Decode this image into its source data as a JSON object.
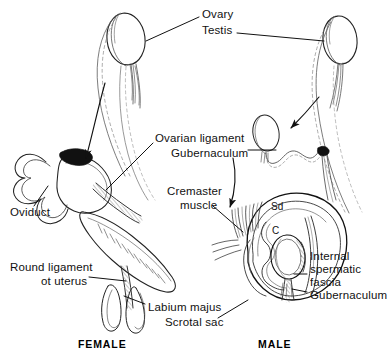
{
  "figure": {
    "background_color": "#ffffff",
    "ink_color": "#111111"
  },
  "captions": [
    {
      "id": "female",
      "text": "FEMALE",
      "x": 78,
      "y": 344
    },
    {
      "id": "male",
      "text": "MALE",
      "x": 258,
      "y": 344
    }
  ],
  "labels": [
    {
      "id": "ovary",
      "text": "Ovary",
      "x": 202,
      "y": 14,
      "align": "left"
    },
    {
      "id": "testis",
      "text": "Testis",
      "x": 202,
      "y": 30,
      "align": "left"
    },
    {
      "id": "ovarian-ligament",
      "text": "Ovarian ligament",
      "x": 155,
      "y": 138,
      "align": "left"
    },
    {
      "id": "gubernaculum-upper",
      "text": "Gubernaculum",
      "x": 171,
      "y": 153,
      "align": "left"
    },
    {
      "id": "cremaster-muscle-line1",
      "text": "Cremaster",
      "x": 167,
      "y": 191,
      "align": "left"
    },
    {
      "id": "cremaster-muscle-line2",
      "text": "muscle",
      "x": 180,
      "y": 205,
      "align": "left"
    },
    {
      "id": "oviduct",
      "text": "Oviduct",
      "x": 10,
      "y": 212,
      "align": "left"
    },
    {
      "id": "round-ligament-line1",
      "text": "Round ligament",
      "x": 10,
      "y": 267,
      "align": "left"
    },
    {
      "id": "round-ligament-line2",
      "text": "ot uterus",
      "x": 41,
      "y": 281,
      "align": "left"
    },
    {
      "id": "labium-majus",
      "text": "Labium majus",
      "x": 148,
      "y": 307,
      "align": "left"
    },
    {
      "id": "scrotal-sac",
      "text": "Scrotal sac",
      "x": 165,
      "y": 322,
      "align": "left"
    },
    {
      "id": "internal-spermatic-line1",
      "text": "Internal",
      "x": 310,
      "y": 256,
      "align": "left"
    },
    {
      "id": "internal-spermatic-line2",
      "text": "spermatic",
      "x": 310,
      "y": 269,
      "align": "left"
    },
    {
      "id": "internal-spermatic-line3",
      "text": "fascia",
      "x": 310,
      "y": 282,
      "align": "left"
    },
    {
      "id": "gubernaculum-lower",
      "text": "Gubernaculum",
      "x": 310,
      "y": 295,
      "align": "left"
    }
  ],
  "inline_marks": [
    {
      "id": "sd-mark",
      "text": "Sd",
      "x": 271,
      "y": 207
    },
    {
      "id": "c-mark",
      "text": "C",
      "x": 272,
      "y": 231
    }
  ]
}
